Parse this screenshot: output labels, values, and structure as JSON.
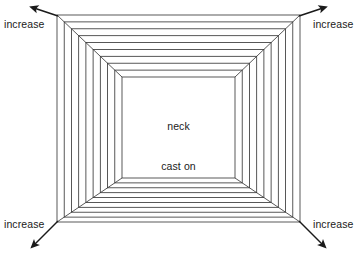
{
  "diagram": {
    "background_color": "#ffffff",
    "line_color": "#3b3b3b",
    "text_color": "#1a1a1a",
    "center_labels": {
      "neck": "neck",
      "cast_on": "cast on"
    },
    "corner_labels": {
      "top_left": "increase",
      "top_right": "increase",
      "bottom_left": "increase",
      "bottom_right": "increase"
    },
    "geometry": {
      "inner_rect": {
        "x1": 122,
        "y1": 77,
        "x2": 235,
        "y2": 178
      },
      "outer_rect": {
        "x1": 57,
        "y1": 15,
        "x2": 300,
        "y2": 222
      },
      "rows": 9,
      "arrow_tips": {
        "top_left": {
          "x": 31,
          "y": 5
        },
        "top_right": {
          "x": 326,
          "y": 5
        },
        "bottom_left": {
          "x": 31,
          "y": 250
        },
        "bottom_right": {
          "x": 326,
          "y": 250
        }
      }
    }
  }
}
